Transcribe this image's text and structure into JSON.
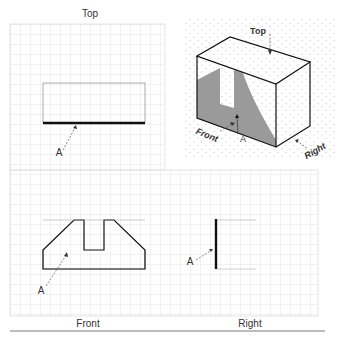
{
  "views": {
    "top": {
      "title": "Top",
      "callout": "A"
    },
    "front": {
      "title": "Front",
      "callout": "A"
    },
    "right": {
      "title": "Right",
      "callout": "A"
    },
    "isometric": {
      "labels": {
        "top": "Top",
        "front": "Front",
        "right": "Right",
        "callout": "A"
      }
    }
  },
  "colors": {
    "grid": "#d0d0d0",
    "line": "#111111",
    "shade": "#9a9a9a",
    "iso_dots": "#c8c8c8"
  }
}
